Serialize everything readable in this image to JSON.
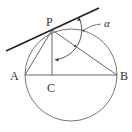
{
  "diagram": {
    "type": "geometry",
    "points": {
      "P": {
        "label": "P"
      },
      "A": {
        "label": "A"
      },
      "B": {
        "label": "B"
      },
      "C": {
        "label": "C"
      }
    },
    "angle_label": "α",
    "colors": {
      "tangent": "#222222",
      "lines": "#555555",
      "circle": "#666666",
      "text": "#333333"
    }
  }
}
